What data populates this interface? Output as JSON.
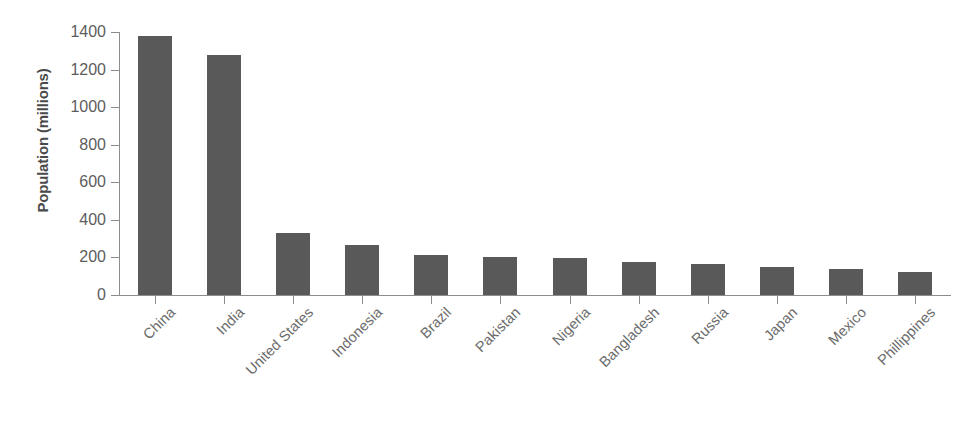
{
  "chart_data": {
    "type": "bar",
    "title": "",
    "xlabel": "",
    "ylabel": "Population (millions)",
    "ylim": [
      0,
      1400
    ],
    "yticks": [
      0,
      200,
      400,
      600,
      800,
      1000,
      1200,
      1400
    ],
    "grid": false,
    "legend": null,
    "bar_color": "#595959",
    "axis_color": "#8c8c8c",
    "tick_label_color": "#5d5d5d",
    "categories": [
      "China",
      "India",
      "United States",
      "Indonesia",
      "Brazil",
      "Pakistan",
      "Nigeria",
      "Bangladesh",
      "Russia",
      "Japan",
      "Mexico",
      "Phillippines"
    ],
    "values": [
      1380,
      1280,
      330,
      265,
      215,
      205,
      198,
      175,
      165,
      148,
      140,
      122
    ],
    "series": [
      {
        "name": "Population (millions)",
        "values": [
          1380,
          1280,
          330,
          265,
          215,
          205,
          198,
          175,
          165,
          148,
          140,
          122
        ]
      }
    ]
  }
}
